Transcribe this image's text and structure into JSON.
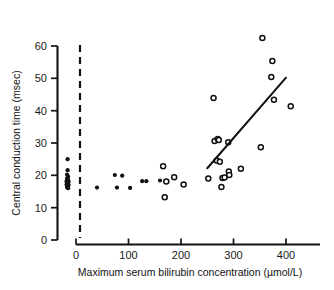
{
  "figure": {
    "background": "#ffffff",
    "ink_color": "#111111"
  },
  "chart_data": {
    "type": "scatter",
    "title": "",
    "subtitle": "",
    "xlabel": "Maximum serum bilirubin concentration (µmol/L)",
    "ylabel": "Central conduction time (msec)",
    "xlim": [
      -40,
      430
    ],
    "ylim": [
      0,
      62
    ],
    "xticks": [
      0,
      100,
      200,
      300,
      400
    ],
    "xtick_labels": [
      "0",
      "100",
      "200",
      "300",
      "400"
    ],
    "yticks": [
      0,
      10,
      20,
      30,
      40,
      50,
      60
    ],
    "ytick_labels": [
      "0",
      "10",
      "20",
      "30",
      "40",
      "50",
      "60"
    ],
    "grid": false,
    "legend": null,
    "annotations": [
      {
        "name": "control-group-divider",
        "type": "vline",
        "x": 8,
        "style": "dashed",
        "note": "dashed vertical line separating control subjects from study subjects"
      }
    ],
    "series": [
      {
        "name": "Controls (filled circles, left of dashed line)",
        "marker": "filled-circle",
        "points": [
          [
            -16,
            25.0
          ],
          [
            -16,
            21.6
          ],
          [
            -17,
            20.2
          ],
          [
            -15,
            19.6
          ],
          [
            -17,
            19.0
          ],
          [
            -15,
            18.6
          ],
          [
            -18,
            18.2
          ],
          [
            -14,
            18.0
          ],
          [
            -16,
            17.6
          ],
          [
            -18,
            17.2
          ],
          [
            -14,
            17.0
          ],
          [
            -16,
            16.6
          ],
          [
            -17,
            16.2
          ],
          [
            -15,
            16.0
          ]
        ]
      },
      {
        "name": "Study subjects, low bilirubin (filled circles)",
        "marker": "filled-circle",
        "points": [
          [
            40,
            16.2
          ],
          [
            74,
            20.1
          ],
          [
            78,
            16.2
          ],
          [
            88,
            19.9
          ],
          [
            103,
            16.1
          ],
          [
            126,
            18.2
          ],
          [
            134,
            18.2
          ],
          [
            160,
            18.4
          ]
        ]
      },
      {
        "name": "Study subjects, higher bilirubin (open circles)",
        "marker": "open-circle",
        "points": [
          [
            166,
            22.8
          ],
          [
            169,
            13.2
          ],
          [
            172,
            18.1
          ],
          [
            187,
            19.4
          ],
          [
            205,
            17.2
          ],
          [
            252,
            19.0
          ],
          [
            262,
            43.9
          ],
          [
            264,
            30.6
          ],
          [
            268,
            24.6
          ],
          [
            270,
            31.2
          ],
          [
            272,
            30.9
          ],
          [
            274,
            24.2
          ],
          [
            277,
            16.4
          ],
          [
            279,
            19.2
          ],
          [
            283,
            19.3
          ],
          [
            290,
            30.2
          ],
          [
            291,
            21.2
          ],
          [
            292,
            20.1
          ],
          [
            314,
            22.0
          ],
          [
            352,
            28.7
          ],
          [
            355,
            62.5
          ],
          [
            372,
            50.4
          ],
          [
            374,
            55.4
          ],
          [
            377,
            43.4
          ],
          [
            409,
            41.4
          ]
        ]
      }
    ],
    "fit_line": {
      "name": "regression-line",
      "x_start": 250,
      "y_start": 22.2,
      "x_end": 400,
      "y_end": 50.2,
      "style": "solid"
    }
  }
}
